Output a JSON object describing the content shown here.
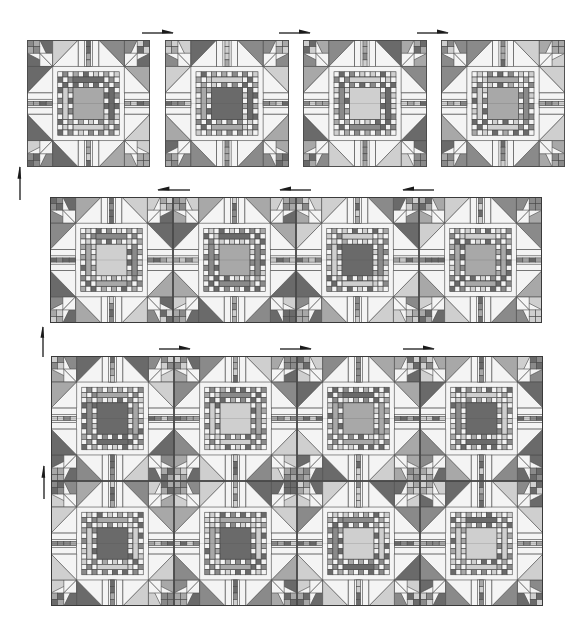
{
  "diagram": {
    "colors": {
      "white": "#f4f4f4",
      "light": "#cfcfcf",
      "medium": "#a8a8a8",
      "mediumDark": "#8a8a8a",
      "dark": "#6a6a6a",
      "line": "#4a4a4a"
    },
    "steps": [
      {
        "id": "row-1-separate-blocks",
        "layout": "separate",
        "blocks": [
          {
            "x": 27,
            "y": 40,
            "w": 123,
            "h": 127,
            "center": "medium",
            "seed": 1
          },
          {
            "x": 165,
            "y": 40,
            "w": 124,
            "h": 127,
            "center": "dark",
            "seed": 2
          },
          {
            "x": 303,
            "y": 40,
            "w": 124,
            "h": 127,
            "center": "light",
            "seed": 3
          },
          {
            "x": 441,
            "y": 40,
            "w": 124,
            "h": 127,
            "center": "medium",
            "seed": 4
          }
        ],
        "arrows": [
          {
            "x": 142,
            "y": 27,
            "w": 32,
            "h": 9,
            "direction": "right"
          },
          {
            "x": 279,
            "y": 27,
            "w": 32,
            "h": 9,
            "direction": "right"
          },
          {
            "x": 417,
            "y": 27,
            "w": 32,
            "h": 9,
            "direction": "right"
          }
        ]
      },
      {
        "id": "row-2-joined-row",
        "layout": "joined",
        "frame": {
          "x": 50,
          "y": 197,
          "w": 492,
          "h": 126
        },
        "blocks": [
          {
            "x": 50,
            "y": 197,
            "w": 123,
            "h": 126,
            "center": "light",
            "seed": 5
          },
          {
            "x": 173,
            "y": 197,
            "w": 123,
            "h": 126,
            "center": "medium",
            "seed": 6
          },
          {
            "x": 296,
            "y": 197,
            "w": 123,
            "h": 126,
            "center": "dark",
            "seed": 7
          },
          {
            "x": 419,
            "y": 197,
            "w": 123,
            "h": 126,
            "center": "medium",
            "seed": 8
          }
        ],
        "arrows": [
          {
            "x": 157,
            "y": 184,
            "w": 33,
            "h": 9,
            "direction": "left"
          },
          {
            "x": 279,
            "y": 184,
            "w": 32,
            "h": 9,
            "direction": "left"
          },
          {
            "x": 402,
            "y": 184,
            "w": 32,
            "h": 9,
            "direction": "left"
          }
        ]
      },
      {
        "id": "rows-joined-quilt",
        "layout": "joined",
        "frame": {
          "x": 51,
          "y": 356,
          "w": 492,
          "h": 250
        },
        "blocks": [
          {
            "x": 51,
            "y": 356,
            "w": 123,
            "h": 125,
            "center": "dark",
            "seed": 9
          },
          {
            "x": 174,
            "y": 356,
            "w": 123,
            "h": 125,
            "center": "light",
            "seed": 10
          },
          {
            "x": 297,
            "y": 356,
            "w": 123,
            "h": 125,
            "center": "medium",
            "seed": 11
          },
          {
            "x": 420,
            "y": 356,
            "w": 123,
            "h": 125,
            "center": "dark",
            "seed": 12
          },
          {
            "x": 51,
            "y": 481,
            "w": 123,
            "h": 125,
            "center": "dark",
            "seed": 13
          },
          {
            "x": 174,
            "y": 481,
            "w": 123,
            "h": 125,
            "center": "dark",
            "seed": 14
          },
          {
            "x": 297,
            "y": 481,
            "w": 123,
            "h": 125,
            "center": "light",
            "seed": 15
          },
          {
            "x": 420,
            "y": 481,
            "w": 123,
            "h": 125,
            "center": "light",
            "seed": 16
          }
        ],
        "arrows": [
          {
            "x": 159,
            "y": 343,
            "w": 32,
            "h": 9,
            "direction": "right"
          },
          {
            "x": 280,
            "y": 343,
            "w": 32,
            "h": 9,
            "direction": "right"
          },
          {
            "x": 403,
            "y": 343,
            "w": 32,
            "h": 9,
            "direction": "right"
          }
        ]
      }
    ],
    "vertical_arrows": [
      {
        "x": 15,
        "y": 166,
        "w": 9,
        "h": 34,
        "direction": "up"
      },
      {
        "x": 38,
        "y": 326,
        "w": 9,
        "h": 31,
        "direction": "up"
      },
      {
        "x": 39,
        "y": 465,
        "w": 9,
        "h": 34,
        "direction": "up"
      }
    ]
  }
}
